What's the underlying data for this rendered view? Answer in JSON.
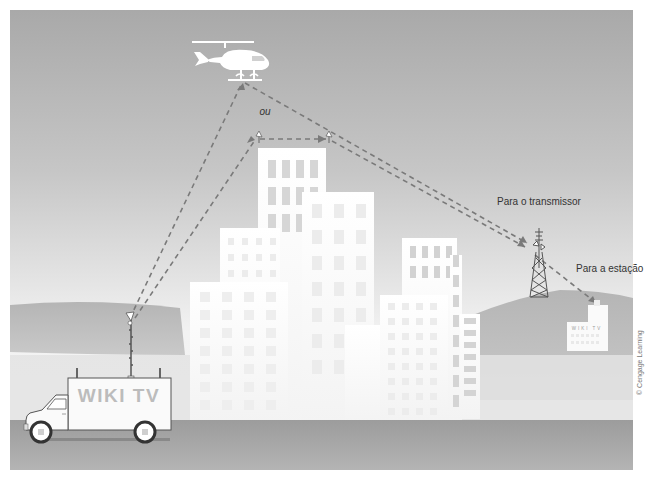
{
  "figure": {
    "labels": {
      "or": "ou",
      "to_transmitter": "Para o transmissor",
      "to_station": "Para a estação"
    },
    "van_text": "WIKI TV",
    "station_text": "WIKI TV",
    "credit": "© Cengage Learning"
  },
  "colors": {
    "sky_top": "#a9a9a9",
    "sky_bottom": "#f2f2f2",
    "hill": "#bdbdbd",
    "ground": "#e6e6e6",
    "road": "#a3a3a3",
    "signal": "#7a7a7a",
    "building": "#fbfbfb",
    "window": "#d8d8d8"
  }
}
